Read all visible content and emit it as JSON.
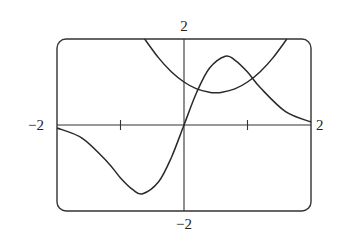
{
  "chart_data": {
    "type": "line",
    "title": "",
    "xlabel": "",
    "ylabel": "",
    "xlim": [
      -2,
      2
    ],
    "ylim": [
      -2,
      2
    ],
    "grid": false,
    "legend": null,
    "tick_labels": {
      "x_min": "−2",
      "x_max": "2",
      "y_min": "−2",
      "y_max": "2"
    },
    "x_ticks": [
      -1,
      1
    ],
    "series": [
      {
        "name": "parabola",
        "description": "upward parabola, vertex near (0.5, 0.75), y-intercept 1",
        "x": [
          -0.62,
          -0.4,
          -0.2,
          0,
          0.2,
          0.4,
          0.5,
          0.6,
          0.8,
          1.0,
          1.2,
          1.4,
          1.62
        ],
        "y": [
          2.0,
          1.56,
          1.24,
          1.0,
          0.84,
          0.76,
          0.75,
          0.76,
          0.84,
          1.0,
          1.24,
          1.56,
          2.0
        ]
      },
      {
        "name": "odd-bump",
        "description": "odd function with max ~1.6 at x≈0.65 and min ~-1.6 at x≈-0.65, decaying to ~0 at ±2",
        "x": [
          -2,
          -1.6,
          -1.2,
          -1.0,
          -0.8,
          -0.65,
          -0.4,
          -0.2,
          0,
          0.2,
          0.4,
          0.65,
          0.8,
          1.0,
          1.2,
          1.6,
          2
        ],
        "y": [
          -0.07,
          -0.31,
          -0.87,
          -1.23,
          -1.51,
          -1.6,
          -1.32,
          -0.76,
          0,
          0.76,
          1.32,
          1.6,
          1.51,
          1.23,
          0.87,
          0.31,
          0.07
        ]
      }
    ]
  }
}
